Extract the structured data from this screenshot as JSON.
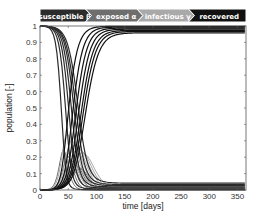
{
  "banner": {
    "stages": [
      {
        "label": "susceptible",
        "param": "β",
        "color": "#2b2b2b"
      },
      {
        "label": "exposed",
        "param": "α",
        "color": "#6e6e6e"
      },
      {
        "label": "infectious",
        "param": "γ",
        "color": "#a9a9a9"
      },
      {
        "label": "recovered",
        "param": "",
        "color": "#111111"
      }
    ]
  },
  "chart_data": {
    "type": "line",
    "title": "",
    "xlabel": "time [days]",
    "ylabel": "population [-]",
    "xlim": [
      0,
      365
    ],
    "ylim": [
      0,
      1
    ],
    "xticks": [
      0,
      50,
      100,
      150,
      200,
      250,
      300,
      350
    ],
    "yticks": [
      0,
      0.1,
      0.2,
      0.3,
      0.4,
      0.5,
      0.6,
      0.7,
      0.8,
      0.9,
      1
    ],
    "grid": false,
    "legend": "banner-top",
    "series": [
      {
        "name": "susceptible",
        "color": "#2b2b2b",
        "role": "S",
        "final_values": [
          0.2,
          0.21,
          0.23,
          0.25,
          0.27,
          0.29,
          0.31
        ]
      },
      {
        "name": "exposed",
        "color": "#6e6e6e",
        "role": "E",
        "peak_values": [
          0.1,
          0.09,
          0.08,
          0.07,
          0.06,
          0.05,
          0.05
        ]
      },
      {
        "name": "infectious",
        "color": "#a9a9a9",
        "role": "I",
        "peak_values": [
          0.15,
          0.13,
          0.12,
          0.1,
          0.09,
          0.08,
          0.07
        ]
      },
      {
        "name": "recovered",
        "color": "#111111",
        "role": "R",
        "final_values": [
          0.79,
          0.78,
          0.76,
          0.74,
          0.72,
          0.7,
          0.68
        ]
      }
    ],
    "runs": [
      {
        "beta": 0.62,
        "onset": 0
      },
      {
        "beta": 0.5,
        "onset": 20
      },
      {
        "beta": 0.44,
        "onset": 40
      },
      {
        "beta": 0.4,
        "onset": 60
      },
      {
        "beta": 0.37,
        "onset": 80
      },
      {
        "beta": 0.35,
        "onset": 100
      },
      {
        "beta": 0.33,
        "onset": 120
      }
    ]
  }
}
